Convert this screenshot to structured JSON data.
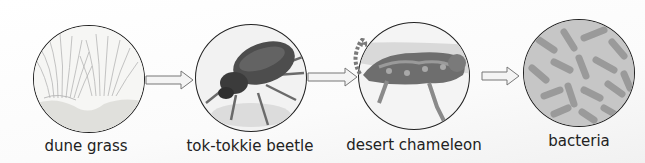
{
  "diagram": {
    "type": "food-chain",
    "nodes": [
      {
        "id": "dune-grass",
        "label": "dune grass"
      },
      {
        "id": "tok-tokkie-beetle",
        "label": "tok-tokkie beetle"
      },
      {
        "id": "desert-chameleon",
        "label": "desert chameleon"
      },
      {
        "id": "bacteria",
        "label": "bacteria"
      }
    ],
    "arrows": [
      {
        "from": "dune-grass",
        "to": "tok-tokkie-beetle"
      },
      {
        "from": "tok-tokkie-beetle",
        "to": "desert-chameleon"
      },
      {
        "from": "desert-chameleon",
        "to": "bacteria"
      }
    ],
    "colors": {
      "outline": "#222222",
      "arrow_fill": "#f4f4f4",
      "arrow_stroke": "#777777"
    }
  }
}
